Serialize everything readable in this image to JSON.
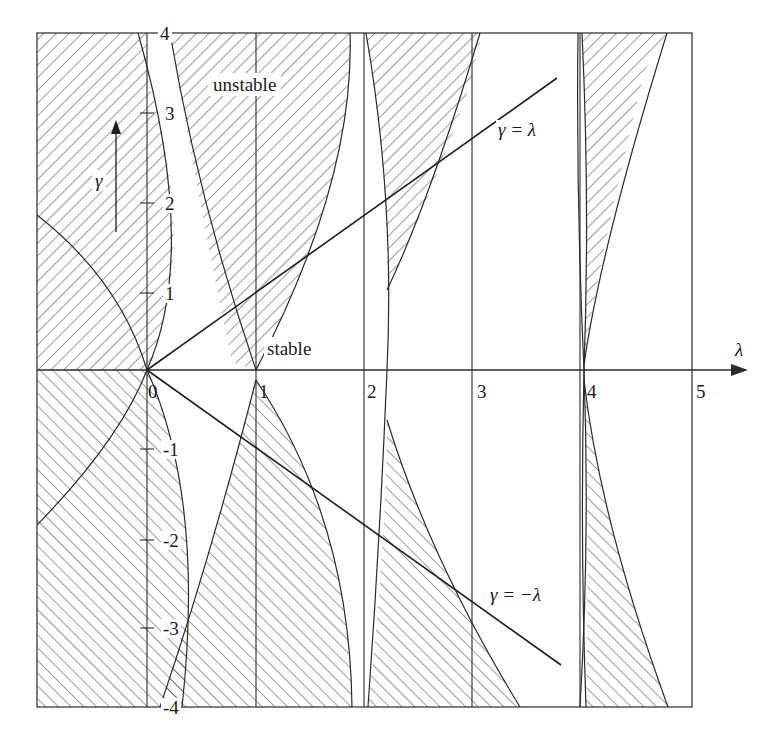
{
  "figure": {
    "type": "stability-diagram",
    "stroke_color": "#2a2a2a",
    "hatch_color": "#3a3a3a",
    "background": "#ffffff"
  },
  "axes": {
    "x": {
      "symbol": "λ",
      "range": [
        -1,
        5
      ],
      "ticks": [
        {
          "value": 0,
          "label": "0"
        },
        {
          "value": 1,
          "label": "1"
        },
        {
          "value": 2,
          "label": "2"
        },
        {
          "value": 3,
          "label": "3"
        },
        {
          "value": 4,
          "label": "4"
        },
        {
          "value": 5,
          "label": "5"
        }
      ]
    },
    "y": {
      "symbol": "γ",
      "range": [
        -4,
        4
      ],
      "ticks": [
        {
          "value": 4,
          "label": "4"
        },
        {
          "value": 3,
          "label": "3"
        },
        {
          "value": 2,
          "label": "2"
        },
        {
          "value": 1,
          "label": "1"
        },
        {
          "value": -1,
          "label": "-1"
        },
        {
          "value": -2,
          "label": "-2"
        },
        {
          "value": -3,
          "label": "-3"
        },
        {
          "value": -4,
          "label": "-4"
        }
      ]
    }
  },
  "annotations": {
    "unstable": "unstable",
    "stable": "stable",
    "line_pos": "γ = λ",
    "line_neg": "γ = −λ",
    "gamma_arrow": "γ"
  },
  "lines": [
    {
      "name": "gamma-equals-lambda",
      "label": "γ = λ",
      "from": [
        0,
        0
      ],
      "to": [
        3.8,
        3.0
      ]
    },
    {
      "name": "gamma-equals-minus-lambda",
      "label": "γ = −λ",
      "from": [
        0,
        0
      ],
      "to": [
        3.8,
        -3.0
      ]
    }
  ]
}
